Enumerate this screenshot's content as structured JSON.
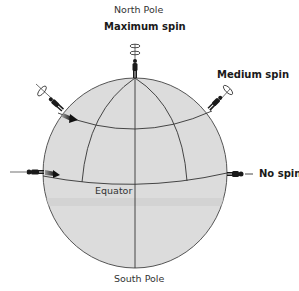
{
  "labels": {
    "north_pole": "North Pole",
    "south_pole": "South Pole",
    "equator": "Equator",
    "maximum_spin": "Maximum spin",
    "medium_spin": "Medium spin",
    "no_spin": "No spin"
  },
  "colors": {
    "globe_fill": "#dcdcdc",
    "globe_stroke": "#555555",
    "grid_line": "#333333",
    "band_shade": "#cfcfcf",
    "figure": "#1a1a1a"
  }
}
